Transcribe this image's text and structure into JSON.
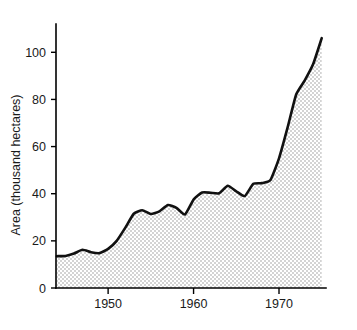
{
  "chart_data": {
    "type": "area",
    "title": "",
    "subtitle": "",
    "xlabel": "",
    "ylabel": "Area (thousand hectares)",
    "xlim": [
      1943.9,
      1975.5
    ],
    "ylim": [
      0,
      112
    ],
    "grid": false,
    "legend": null,
    "legend_position": "none",
    "x_ticks": [
      1950,
      1960,
      1970
    ],
    "x_tick_labels": [
      "1950",
      "1960",
      "1970"
    ],
    "y_ticks": [
      0,
      20,
      40,
      60,
      80,
      100
    ],
    "y_tick_labels": [
      "0",
      "20",
      "40",
      "60",
      "80",
      "100"
    ],
    "fill_color": "#d8d8d8",
    "line_color": "#111111",
    "axis_color": "#000000",
    "background_color": "#ffffff",
    "series": [
      {
        "name": "Area",
        "x": [
          1944,
          1945,
          1946,
          1947,
          1948,
          1949,
          1950,
          1951,
          1952,
          1953,
          1954,
          1955,
          1956,
          1957,
          1958,
          1959,
          1960,
          1961,
          1962,
          1963,
          1964,
          1965,
          1966,
          1967,
          1968,
          1969,
          1970,
          1971,
          1972,
          1973,
          1974,
          1975
        ],
        "values": [
          13.5,
          13.6,
          14.6,
          16.2,
          15.2,
          14.8,
          16.6,
          20.0,
          25.5,
          31.5,
          33.0,
          31.4,
          32.5,
          35.2,
          34.0,
          31.2,
          37.5,
          40.5,
          40.4,
          40.2,
          43.4,
          41.0,
          39.0,
          44.2,
          44.5,
          45.8,
          55.0,
          68.0,
          82.0,
          88.0,
          95.0,
          106.0
        ]
      }
    ],
    "annotations": []
  },
  "axis": {
    "y_title": "Area (thousand hectares)"
  }
}
